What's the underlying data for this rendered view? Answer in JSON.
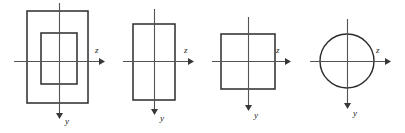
{
  "diagram": {
    "background_color": "#ffffff",
    "shape_stroke_color": "#2b2b2b",
    "axis_stroke_color": "#55534f",
    "label_color": "#1d1d1d",
    "axis_labels": {
      "horizontal": "z",
      "vertical": "y"
    },
    "figures": [
      {
        "id": "figure-1",
        "name": "hollow-rectangle",
        "shape": "rectangle-with-inner-rectangle",
        "z_label": "z",
        "y_label": "y",
        "outer": {
          "x": 27,
          "y": 11,
          "width": 61,
          "height": 92
        },
        "inner": {
          "x": 41,
          "y": 33,
          "width": 36,
          "height": 51
        },
        "origin": {
          "x": 59,
          "y": 61
        },
        "z_axis": {
          "x1": 14,
          "x2": 103,
          "y": 61
        },
        "y_axis": {
          "x": 59,
          "y1": 3,
          "y2": 118
        }
      },
      {
        "id": "figure-2",
        "name": "tall-rectangle",
        "shape": "rectangle",
        "z_label": "z",
        "y_label": "y",
        "outer": {
          "x": 133,
          "y": 24,
          "width": 42,
          "height": 76
        },
        "origin": {
          "x": 154,
          "y": 61
        },
        "z_axis": {
          "x1": 123,
          "x2": 192,
          "y": 61
        },
        "y_axis": {
          "x": 154,
          "y1": 9,
          "y2": 114
        }
      },
      {
        "id": "figure-3",
        "name": "square",
        "shape": "square",
        "z_label": "z",
        "y_label": "y",
        "outer": {
          "x": 221,
          "y": 34,
          "width": 54,
          "height": 55
        },
        "origin": {
          "x": 248,
          "y": 61
        },
        "z_axis": {
          "x1": 212,
          "x2": 289,
          "y": 61
        },
        "y_axis": {
          "x": 248,
          "y1": 17,
          "y2": 110
        }
      },
      {
        "id": "figure-4",
        "name": "circle",
        "shape": "circle",
        "z_label": "z",
        "y_label": "y",
        "circle": {
          "cx": 347,
          "cy": 61,
          "r": 27
        },
        "origin": {
          "x": 347,
          "y": 61
        },
        "z_axis": {
          "x1": 310,
          "x2": 389,
          "y": 61
        },
        "y_axis": {
          "x": 347,
          "y1": 19,
          "y2": 108
        }
      }
    ]
  }
}
